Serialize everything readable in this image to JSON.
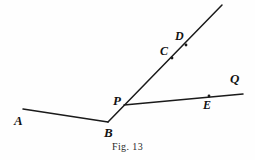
{
  "figure": {
    "caption": "Fig. 13",
    "background_color": "#fefefe",
    "stroke_color": "#1a1a1a",
    "label_color": "#121212",
    "width": 255,
    "height": 160
  },
  "points": [
    {
      "id": "A",
      "label": "A",
      "x": 23,
      "y": 109,
      "label_x": 14,
      "label_y": 114,
      "font_size": 13,
      "has_dot": false
    },
    {
      "id": "B",
      "label": "B",
      "x": 108,
      "y": 122,
      "label_x": 104,
      "label_y": 126,
      "font_size": 13,
      "has_dot": false
    },
    {
      "id": "P",
      "label": "P",
      "x": 124,
      "y": 105,
      "label_x": 113,
      "label_y": 94,
      "font_size": 13,
      "has_dot": false
    },
    {
      "id": "C",
      "label": "C",
      "x": 172,
      "y": 58,
      "label_x": 160,
      "label_y": 45,
      "font_size": 12,
      "has_dot": true
    },
    {
      "id": "D",
      "label": "D",
      "x": 186,
      "y": 45,
      "label_x": 175,
      "label_y": 30,
      "font_size": 12,
      "has_dot": true
    },
    {
      "id": "E",
      "label": "E",
      "x": 209,
      "y": 96,
      "label_x": 203,
      "label_y": 99,
      "font_size": 12,
      "has_dot": true
    },
    {
      "id": "Q",
      "label": "Q",
      "x": 243,
      "y": 94,
      "label_x": 230,
      "label_y": 72,
      "font_size": 13,
      "has_dot": false
    }
  ],
  "segments": [
    {
      "id": "segment-ab",
      "name": "A-to-B",
      "x1": 23,
      "y1": 109,
      "x2": 108,
      "y2": 122,
      "width": 1.5
    },
    {
      "id": "ray-b-through-p",
      "name": "B-through-P-upward",
      "x1": 108,
      "y1": 122,
      "x2": 222,
      "y2": 5,
      "width": 1.5
    },
    {
      "id": "ray-p-to-q",
      "name": "P-through-E-to-Q",
      "x1": 124,
      "y1": 105,
      "x2": 243,
      "y2": 94,
      "width": 1.5
    }
  ],
  "caption_position": {
    "x": 127,
    "y": 142,
    "font_size": 10
  }
}
